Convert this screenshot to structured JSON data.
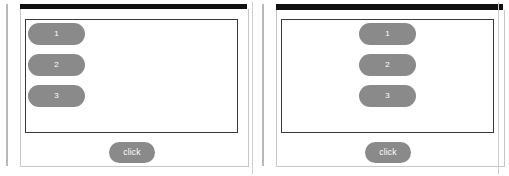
{
  "colors": {
    "pill_fill": "#8a8a8a",
    "pill_text": "#ffffff",
    "titlebar": "#111111",
    "frame_border": "#c8c8c8",
    "content_border": "#3a3a3a",
    "background": "#ffffff",
    "edge_rule": "#b9b9b9"
  },
  "panels": [
    {
      "id": "left",
      "alignment": "left",
      "items": [
        {
          "label": "1"
        },
        {
          "label": "2"
        },
        {
          "label": "3"
        }
      ],
      "button": {
        "label": "click"
      }
    },
    {
      "id": "right",
      "alignment": "center",
      "items": [
        {
          "label": "1"
        },
        {
          "label": "2"
        },
        {
          "label": "3"
        }
      ],
      "button": {
        "label": "click"
      }
    }
  ]
}
